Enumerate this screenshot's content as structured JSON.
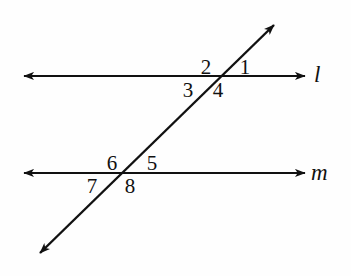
{
  "figure": {
    "type": "geometry-diagram",
    "background_color": "#fefefe",
    "stroke_color": "#111111"
  },
  "lines": [
    {
      "id": "line-l",
      "label": "l",
      "orientation": "horizontal",
      "y": 76,
      "x_start": 22,
      "x_end": 307,
      "arrowheads": "both",
      "label_x": 314,
      "label_y": 64
    },
    {
      "id": "line-m",
      "label": "m",
      "orientation": "horizontal",
      "y": 173,
      "x_start": 22,
      "x_end": 307,
      "arrowheads": "both",
      "label_x": 313,
      "label_y": 161
    },
    {
      "id": "transversal",
      "label": "",
      "orientation": "diagonal",
      "x_start": 37,
      "y_start": 256,
      "x_end": 277,
      "y_end": 22,
      "arrowheads": "both"
    }
  ],
  "intersections": [
    {
      "id": "intersection-upper",
      "on_line": "l",
      "x": 213,
      "y": 76
    },
    {
      "id": "intersection-lower",
      "on_line": "m",
      "x": 125,
      "y": 173
    }
  ],
  "angle_labels": [
    {
      "id": "angle-1",
      "text": "1",
      "x": 234,
      "y": 57,
      "position": "upper-right-of-upper-intersection"
    },
    {
      "id": "angle-2",
      "text": "2",
      "x": 195,
      "y": 57,
      "position": "upper-left-of-upper-intersection"
    },
    {
      "id": "angle-3",
      "text": "3",
      "x": 177,
      "y": 80,
      "position": "lower-left-of-upper-intersection"
    },
    {
      "id": "angle-4",
      "text": "4",
      "x": 207,
      "y": 80,
      "position": "lower-right-of-upper-intersection"
    },
    {
      "id": "angle-5",
      "text": "5",
      "x": 141,
      "y": 153,
      "position": "upper-right-of-lower-intersection"
    },
    {
      "id": "angle-6",
      "text": "6",
      "x": 101,
      "y": 153,
      "position": "upper-left-of-lower-intersection"
    },
    {
      "id": "angle-7",
      "text": "7",
      "x": 81,
      "y": 176,
      "position": "lower-left-of-lower-intersection"
    },
    {
      "id": "angle-8",
      "text": "8",
      "x": 119,
      "y": 176,
      "position": "lower-right-of-lower-intersection"
    }
  ]
}
